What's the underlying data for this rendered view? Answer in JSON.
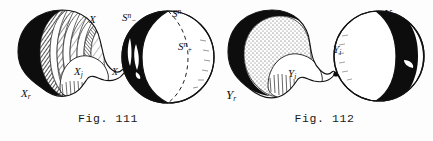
{
  "page": {
    "background_color": "#fdfdfd",
    "ink_color": "#111111",
    "width": 433,
    "height": 141,
    "kind": "scanned-textbook-figure-pair"
  },
  "figures": [
    {
      "id": "fig-111",
      "caption": "Fig. 111",
      "description": "Hatched banded blob wedged at a point to a sphere split into black and white hemispheres",
      "labels": [
        {
          "name": "label-x",
          "base": "X",
          "sup": "",
          "sub": "",
          "x": 89,
          "y": 14
        },
        {
          "name": "label-x-j",
          "base": "X",
          "sup": "",
          "sub": "j",
          "x": 74,
          "y": 66
        },
        {
          "name": "label-x-neck",
          "base": "X",
          "sup": "",
          "sub": "",
          "x": 112,
          "y": 68
        },
        {
          "name": "label-x-r",
          "base": "X",
          "sup": "",
          "sub": "r",
          "x": 21,
          "y": 88
        },
        {
          "name": "label-s-n-minus",
          "base": "S",
          "sup": "n",
          "sub": "−",
          "x": 122,
          "y": 12
        },
        {
          "name": "label-s-n",
          "base": "S",
          "sup": "n",
          "sub": "",
          "x": 172,
          "y": 8
        },
        {
          "name": "label-s-n-plus",
          "base": "S",
          "sup": "n",
          "sub": "+",
          "x": 178,
          "y": 41
        }
      ]
    },
    {
      "id": "fig-112",
      "caption": "Fig. 112",
      "description": "Stippled blob with black crescent wedged at a point to a sphere with black band",
      "labels": [
        {
          "name": "label-y-r-left",
          "base": "Y",
          "sup": "",
          "sub": "r",
          "x": 10,
          "y": 88
        },
        {
          "name": "label-y-i-blob",
          "base": "Y",
          "sup": "",
          "sub": "i",
          "x": 72,
          "y": 68
        },
        {
          "name": "label-y-i-sphere",
          "base": "Y",
          "sup": "",
          "sub": "i",
          "x": 117,
          "y": 44
        },
        {
          "name": "label-y-r-right",
          "base": "Y",
          "sup": "",
          "sub": "r",
          "x": 168,
          "y": 7
        }
      ]
    }
  ]
}
